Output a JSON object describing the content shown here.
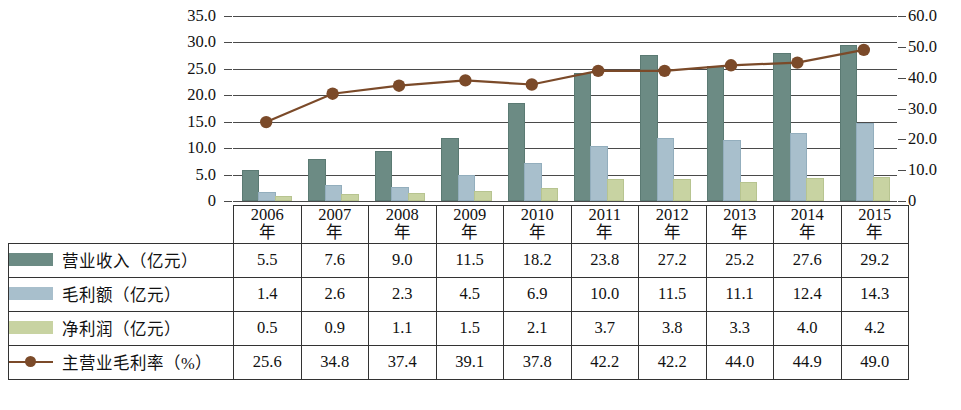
{
  "chart_data": {
    "type": "bar",
    "title": "",
    "subtitle": "",
    "xlabel": "",
    "ylabel": "",
    "y2label": "",
    "grid": true,
    "legend_position": "table-left",
    "categories": [
      "2006年",
      "2007年",
      "2008年",
      "2009年",
      "2010年",
      "2011年",
      "2012年",
      "2013年",
      "2014年",
      "2015年"
    ],
    "ylim": [
      0,
      35
    ],
    "y2lim": [
      0,
      60
    ],
    "yticks": [
      "0",
      "5.0",
      "10.0",
      "15.0",
      "20.0",
      "25.0",
      "30.0",
      "35.0"
    ],
    "y2ticks": [
      "0",
      "10.0",
      "20.0",
      "30.0",
      "40.0",
      "50.0",
      "60.0"
    ],
    "series": [
      {
        "name": "营业收入（亿元）",
        "kind": "bar",
        "axis": "left",
        "color": "#6c8b84",
        "values": [
          5.5,
          7.6,
          9.0,
          11.5,
          18.2,
          23.8,
          27.2,
          25.2,
          27.6,
          29.2
        ]
      },
      {
        "name": "毛利额（亿元）",
        "kind": "bar",
        "axis": "left",
        "color": "#a8bfcc",
        "values": [
          1.4,
          2.6,
          2.3,
          4.5,
          6.9,
          10.0,
          11.5,
          11.1,
          12.4,
          14.3
        ]
      },
      {
        "name": "净利润（亿元）",
        "kind": "bar",
        "axis": "left",
        "color": "#c8d3a2",
        "values": [
          0.5,
          0.9,
          1.1,
          1.5,
          2.1,
          3.7,
          3.8,
          3.3,
          4.0,
          4.2
        ]
      },
      {
        "name": "主营业毛利率（%）",
        "kind": "line",
        "axis": "right",
        "color": "#7b4a29",
        "values": [
          25.6,
          34.8,
          37.4,
          39.1,
          37.8,
          42.2,
          42.2,
          44.0,
          44.9,
          49.0
        ]
      }
    ]
  },
  "table": {
    "year_suffix": "年",
    "years": [
      "2006",
      "2007",
      "2008",
      "2009",
      "2010",
      "2011",
      "2012",
      "2013",
      "2014",
      "2015"
    ],
    "rows": [
      {
        "label": "营业收入（亿元）",
        "swatch": "rev",
        "values": [
          "5.5",
          "7.6",
          "9.0",
          "11.5",
          "18.2",
          "23.8",
          "27.2",
          "25.2",
          "27.6",
          "29.2"
        ]
      },
      {
        "label": "毛利额（亿元）",
        "swatch": "gp",
        "values": [
          "1.4",
          "2.6",
          "2.3",
          "4.5",
          "6.9",
          "10.0",
          "11.5",
          "11.1",
          "12.4",
          "14.3"
        ]
      },
      {
        "label": "净利润（亿元）",
        "swatch": "np",
        "values": [
          "0.5",
          "0.9",
          "1.1",
          "1.5",
          "2.1",
          "3.7",
          "3.8",
          "3.3",
          "4.0",
          "4.2"
        ]
      },
      {
        "label": "主营业毛利率（%）",
        "swatch": "line",
        "values": [
          "25.6",
          "34.8",
          "37.4",
          "39.1",
          "37.8",
          "42.2",
          "42.2",
          "44.0",
          "44.9",
          "49.0"
        ]
      }
    ]
  },
  "colors": {
    "revenue": "#6c8b84",
    "gross_profit": "#a8bfcc",
    "net_profit": "#c8d3a2",
    "margin_line": "#7b4a29",
    "gridline": "#4a4a4a",
    "table_border": "#333333"
  }
}
